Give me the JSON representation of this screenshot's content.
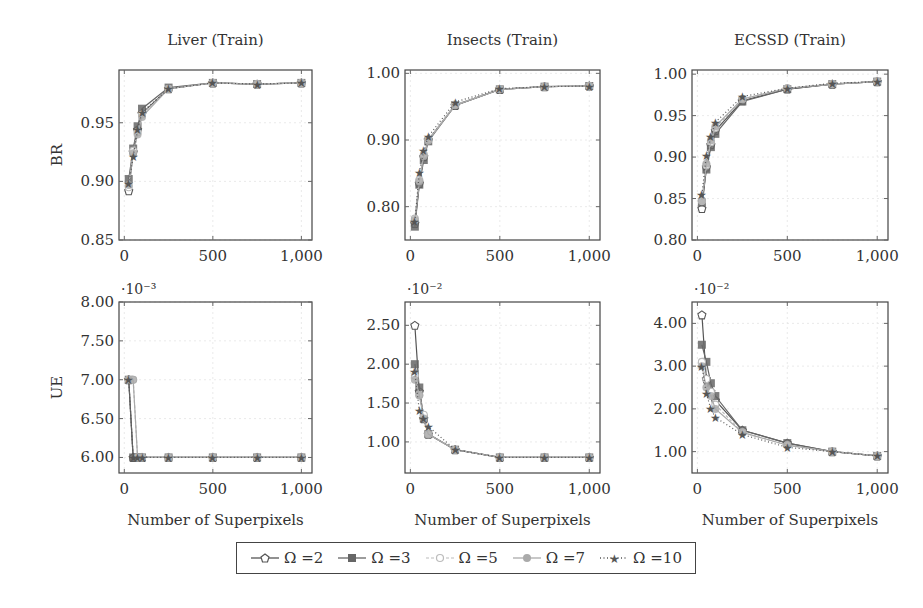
{
  "chart_data": [
    {
      "type": "line",
      "title": "Liver (Train)",
      "xlabel": "",
      "ylabel": "BR",
      "xlim": [
        -30,
        1060
      ],
      "ylim": [
        0.85,
        0.995
      ],
      "xticks": [
        0,
        500,
        1000
      ],
      "xtick_labels": [
        "0",
        "500",
        "1,000"
      ],
      "yticks": [
        0.85,
        0.9,
        0.95
      ],
      "ytick_labels": [
        "0.85",
        "0.90",
        "0.95"
      ],
      "grid": true,
      "x": [
        25,
        50,
        75,
        100,
        250,
        500,
        750,
        1000
      ],
      "series": [
        {
          "name": "Ω =2",
          "values": [
            0.892,
            0.925,
            0.944,
            0.958,
            0.979,
            0.984,
            0.983,
            0.984
          ]
        },
        {
          "name": "Ω =3",
          "values": [
            0.902,
            0.928,
            0.947,
            0.962,
            0.98,
            0.984,
            0.983,
            0.984
          ]
        },
        {
          "name": "Ω =5",
          "values": [
            0.895,
            0.926,
            0.942,
            0.957,
            0.979,
            0.984,
            0.983,
            0.984
          ]
        },
        {
          "name": "Ω =7",
          "values": [
            0.897,
            0.924,
            0.94,
            0.955,
            0.979,
            0.984,
            0.983,
            0.984
          ]
        },
        {
          "name": "Ω =10",
          "values": [
            0.898,
            0.921,
            0.944,
            0.959,
            0.979,
            0.984,
            0.983,
            0.984
          ]
        }
      ]
    },
    {
      "type": "line",
      "title": "Insects (Train)",
      "xlabel": "",
      "ylabel": "",
      "xlim": [
        -30,
        1060
      ],
      "ylim": [
        0.75,
        1.005
      ],
      "xticks": [
        0,
        500,
        1000
      ],
      "xtick_labels": [
        "0",
        "500",
        "1,000"
      ],
      "yticks": [
        0.8,
        0.9,
        1.0
      ],
      "ytick_labels": [
        "0.80",
        "0.90",
        "1.00"
      ],
      "grid": true,
      "x": [
        25,
        50,
        75,
        100,
        250,
        500,
        750,
        1000
      ],
      "series": [
        {
          "name": "Ω =2",
          "values": [
            0.775,
            0.835,
            0.875,
            0.9,
            0.952,
            0.976,
            0.98,
            0.981
          ]
        },
        {
          "name": "Ω =3",
          "values": [
            0.77,
            0.833,
            0.87,
            0.898,
            0.952,
            0.976,
            0.98,
            0.981
          ]
        },
        {
          "name": "Ω =5",
          "values": [
            0.782,
            0.84,
            0.878,
            0.9,
            0.953,
            0.976,
            0.98,
            0.981
          ]
        },
        {
          "name": "Ω =7",
          "values": [
            0.78,
            0.838,
            0.876,
            0.899,
            0.952,
            0.976,
            0.98,
            0.981
          ]
        },
        {
          "name": "Ω =10",
          "values": [
            0.778,
            0.852,
            0.884,
            0.905,
            0.957,
            0.977,
            0.98,
            0.981
          ]
        }
      ]
    },
    {
      "type": "line",
      "title": "ECSSD (Train)",
      "xlabel": "",
      "ylabel": "",
      "xlim": [
        -30,
        1060
      ],
      "ylim": [
        0.8,
        1.005
      ],
      "xticks": [
        0,
        500,
        1000
      ],
      "xtick_labels": [
        "0",
        "500",
        "1,000"
      ],
      "yticks": [
        0.8,
        0.85,
        0.9,
        0.95,
        1.0
      ],
      "ytick_labels": [
        "0.80",
        "0.85",
        "0.90",
        "0.95",
        "1.00"
      ],
      "grid": true,
      "x": [
        25,
        50,
        75,
        100,
        250,
        500,
        750,
        1000
      ],
      "series": [
        {
          "name": "Ω =2",
          "values": [
            0.838,
            0.888,
            0.915,
            0.932,
            0.968,
            0.982,
            0.988,
            0.991
          ]
        },
        {
          "name": "Ω =3",
          "values": [
            0.845,
            0.885,
            0.912,
            0.928,
            0.967,
            0.982,
            0.988,
            0.991
          ]
        },
        {
          "name": "Ω =5",
          "values": [
            0.847,
            0.89,
            0.918,
            0.935,
            0.97,
            0.983,
            0.988,
            0.991
          ]
        },
        {
          "name": "Ω =7",
          "values": [
            0.848,
            0.892,
            0.92,
            0.937,
            0.97,
            0.983,
            0.988,
            0.991
          ]
        },
        {
          "name": "Ω =10",
          "values": [
            0.855,
            0.902,
            0.925,
            0.942,
            0.973,
            0.983,
            0.989,
            0.991
          ]
        }
      ]
    },
    {
      "type": "line",
      "title": "",
      "xlabel": "Number of Superpixels",
      "ylabel": "UE",
      "scale_label": "·10⁻³",
      "xlim": [
        -30,
        1060
      ],
      "ylim": [
        5.8,
        8.0
      ],
      "xticks": [
        0,
        500,
        1000
      ],
      "xtick_labels": [
        "0",
        "500",
        "1,000"
      ],
      "yticks": [
        6.0,
        6.5,
        7.0,
        7.5,
        8.0
      ],
      "ytick_labels": [
        "6.00",
        "6.50",
        "7.00",
        "7.50",
        "8.00"
      ],
      "grid": true,
      "x": [
        25,
        50,
        75,
        100,
        250,
        500,
        750,
        1000
      ],
      "series": [
        {
          "name": "Ω =2",
          "values": [
            7.0,
            6.0,
            6.0,
            6.0,
            6.0,
            6.0,
            6.0,
            6.0
          ]
        },
        {
          "name": "Ω =3",
          "values": [
            7.0,
            6.0,
            6.0,
            6.0,
            6.0,
            6.0,
            6.0,
            6.0
          ]
        },
        {
          "name": "Ω =5",
          "values": [
            7.0,
            7.0,
            6.0,
            6.0,
            6.0,
            6.0,
            6.0,
            6.0
          ]
        },
        {
          "name": "Ω =7",
          "values": [
            7.0,
            7.0,
            6.0,
            6.0,
            6.0,
            6.0,
            6.0,
            6.0
          ]
        },
        {
          "name": "Ω =10",
          "values": [
            7.0,
            6.0,
            6.0,
            6.0,
            6.0,
            6.0,
            6.0,
            6.0
          ]
        }
      ]
    },
    {
      "type": "line",
      "title": "",
      "xlabel": "Number of Superpixels",
      "ylabel": "",
      "scale_label": "·10⁻²",
      "xlim": [
        -30,
        1060
      ],
      "ylim": [
        0.6,
        2.8
      ],
      "xticks": [
        0,
        500,
        1000
      ],
      "xtick_labels": [
        "0",
        "500",
        "1,000"
      ],
      "yticks": [
        1.0,
        1.5,
        2.0,
        2.5
      ],
      "ytick_labels": [
        "1.00",
        "1.50",
        "2.00",
        "2.50"
      ],
      "grid": true,
      "x": [
        25,
        50,
        75,
        100,
        250,
        500,
        750,
        1000
      ],
      "series": [
        {
          "name": "Ω =2",
          "values": [
            2.5,
            1.65,
            1.3,
            1.1,
            0.9,
            0.8,
            0.8,
            0.8
          ]
        },
        {
          "name": "Ω =3",
          "values": [
            2.0,
            1.7,
            1.3,
            1.1,
            0.9,
            0.8,
            0.8,
            0.8
          ]
        },
        {
          "name": "Ω =5",
          "values": [
            1.85,
            1.6,
            1.35,
            1.1,
            0.9,
            0.8,
            0.8,
            0.8
          ]
        },
        {
          "name": "Ω =7",
          "values": [
            1.8,
            1.6,
            1.3,
            1.1,
            0.9,
            0.8,
            0.8,
            0.8
          ]
        },
        {
          "name": "Ω =10",
          "values": [
            1.9,
            1.4,
            1.3,
            1.2,
            0.9,
            0.8,
            0.8,
            0.8
          ]
        }
      ]
    },
    {
      "type": "line",
      "title": "",
      "xlabel": "Number of Superpixels",
      "ylabel": "",
      "scale_label": "·10⁻²",
      "xlim": [
        -30,
        1060
      ],
      "ylim": [
        0.5,
        4.5
      ],
      "xticks": [
        0,
        500,
        1000
      ],
      "xtick_labels": [
        "0",
        "500",
        "1,000"
      ],
      "yticks": [
        1.0,
        2.0,
        3.0,
        4.0
      ],
      "ytick_labels": [
        "1.00",
        "2.00",
        "3.00",
        "4.00"
      ],
      "grid": true,
      "x": [
        25,
        50,
        75,
        100,
        250,
        500,
        750,
        1000
      ],
      "series": [
        {
          "name": "Ω =2",
          "values": [
            4.2,
            2.7,
            2.4,
            2.2,
            1.5,
            1.2,
            1.0,
            0.9
          ]
        },
        {
          "name": "Ω =3",
          "values": [
            3.5,
            3.1,
            2.6,
            2.3,
            1.5,
            1.2,
            1.0,
            0.9
          ]
        },
        {
          "name": "Ω =5",
          "values": [
            3.1,
            2.7,
            2.4,
            2.1,
            1.45,
            1.15,
            1.0,
            0.9
          ]
        },
        {
          "name": "Ω =7",
          "values": [
            3.0,
            2.5,
            2.3,
            2.0,
            1.45,
            1.15,
            1.0,
            0.9
          ]
        },
        {
          "name": "Ω =10",
          "values": [
            3.0,
            2.35,
            2.0,
            1.8,
            1.4,
            1.1,
            1.0,
            0.9
          ]
        }
      ]
    }
  ],
  "legend": {
    "position": "bottom-center",
    "entries": [
      {
        "label": "Ω =2",
        "marker": "pentagon-open",
        "line": "solid",
        "color": "#555555"
      },
      {
        "label": "Ω =3",
        "marker": "square-filled",
        "line": "solid",
        "color": "#666666"
      },
      {
        "label": "Ω =5",
        "marker": "circle-open",
        "line": "dashed",
        "color": "#bbbbbb"
      },
      {
        "label": "Ω =7",
        "marker": "circle-filled",
        "line": "solid",
        "color": "#aaaaaa"
      },
      {
        "label": "Ω =10",
        "marker": "star",
        "line": "dotted",
        "color": "#555555"
      }
    ]
  }
}
